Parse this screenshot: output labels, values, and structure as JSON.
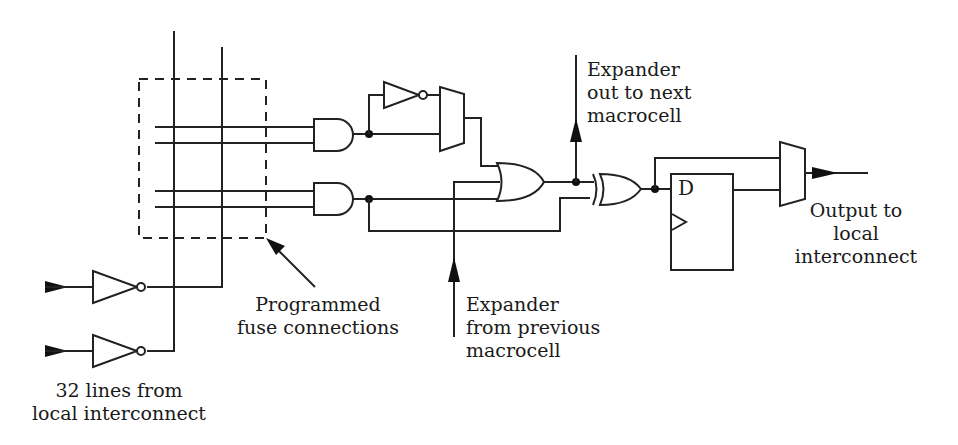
{
  "diagram": {
    "labels": {
      "expander_out": [
        "Expander",
        "out to next",
        "macrocell"
      ],
      "output": [
        "Output to",
        "local",
        "interconnect"
      ],
      "fuse": [
        "Programmed",
        "fuse connections"
      ],
      "expander_in": [
        "Expander",
        "from previous",
        "macrocell"
      ],
      "input_lines": [
        "32 lines from",
        "local interconnect"
      ],
      "flipflop_d": "D"
    },
    "components": [
      {
        "id": "input-inverter-1",
        "type": "inverter"
      },
      {
        "id": "input-inverter-2",
        "type": "inverter"
      },
      {
        "id": "fuse-array",
        "type": "programmable-interconnect"
      },
      {
        "id": "and-gate-1",
        "type": "and"
      },
      {
        "id": "and-gate-2",
        "type": "and"
      },
      {
        "id": "polarity-inverter",
        "type": "inverter"
      },
      {
        "id": "polarity-mux",
        "type": "mux"
      },
      {
        "id": "or-gate",
        "type": "or"
      },
      {
        "id": "xor-gate",
        "type": "xor"
      },
      {
        "id": "d-flipflop",
        "type": "flip-flop"
      },
      {
        "id": "output-mux",
        "type": "mux"
      }
    ],
    "colors": {
      "line": "#222222",
      "background": "#ffffff"
    }
  }
}
